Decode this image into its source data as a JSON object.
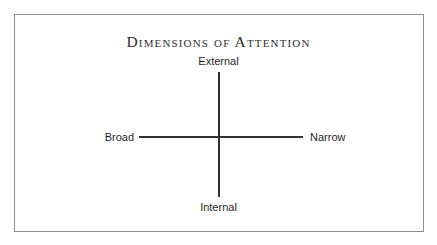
{
  "figure": {
    "title": "Dimensions of Attention",
    "background_color": "#ffffff",
    "frame_color": "#8d8d8d",
    "axis_color": "#333333",
    "text_color": "#1f1f1f"
  },
  "chart_data": {
    "type": "diagram",
    "subtype": "two-axis-cross",
    "title": "Dimensions of Attention",
    "axes": [
      {
        "name": "direction-axis",
        "orientation": "vertical",
        "positive_pole": "External",
        "negative_pole": "Internal"
      },
      {
        "name": "width-axis",
        "orientation": "horizontal",
        "positive_pole": "Narrow",
        "negative_pole": "Broad"
      }
    ],
    "labels": {
      "top": "External",
      "bottom": "Internal",
      "left": "Broad",
      "right": "Narrow"
    },
    "grid": false,
    "legend": false,
    "annotations": []
  }
}
